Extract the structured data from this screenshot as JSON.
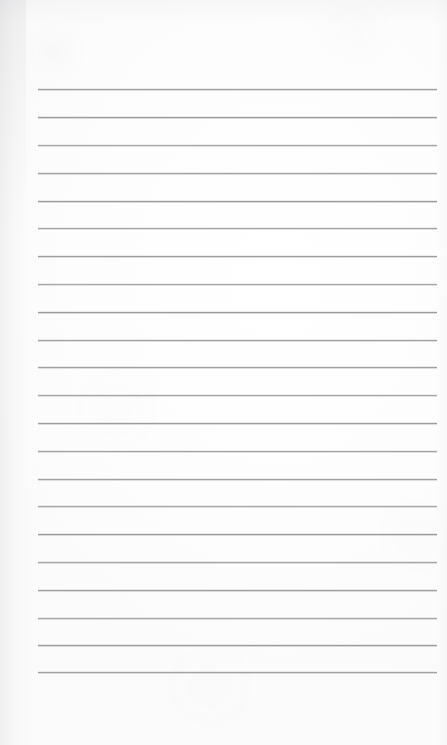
{
  "document": {
    "kind": "scanned-blank-lined-page",
    "page_label": "",
    "body_text": "",
    "width_px": 447,
    "height_px": 745,
    "background_color": "#fefefe"
  },
  "ruling": {
    "line_color": "#9a9a9f",
    "line_thickness_px": 1,
    "line_count": 22,
    "left_margin_px": 38,
    "right_edge_px": 437,
    "first_line_y_px": 89,
    "line_spacing_px": 27.75,
    "lines_y": [
      89,
      117,
      145,
      173,
      201,
      228,
      256,
      284,
      312,
      340,
      367,
      395,
      423,
      451,
      479,
      506,
      534,
      562,
      590,
      618,
      645,
      672
    ]
  },
  "artifacts": {
    "left_edge_shadow": true,
    "top_edge_shadow": true,
    "right_edge_shadow": true,
    "paper_grain": true,
    "shadow_color": "#78788a"
  }
}
